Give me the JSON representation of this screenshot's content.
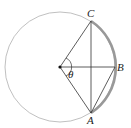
{
  "diagram": {
    "type": "circle-geometry",
    "center": {
      "x": 60,
      "y": 67
    },
    "radius": 55,
    "points": {
      "C": {
        "label": "C",
        "x": 91,
        "y": 21
      },
      "B": {
        "label": "B",
        "x": 116,
        "y": 67
      },
      "A": {
        "label": "A",
        "x": 91,
        "y": 113
      }
    },
    "angle_label": "θ",
    "colors": {
      "circle": "#aaaaaa",
      "lines": "#333333",
      "arc_highlight": "#999999"
    }
  }
}
